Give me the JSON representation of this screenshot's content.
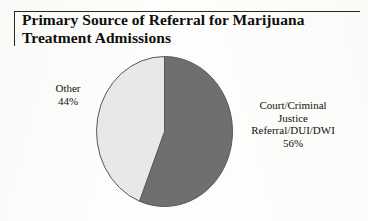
{
  "chart_data": {
    "type": "pie",
    "title": "Primary Source of Referral for Marijuana Treatment Admissions",
    "title_lines": [
      "Primary Source of Referral for Marijuana",
      "Treatment Admissions"
    ],
    "categories": [
      "Court/Criminal Justice Referral/DUI/DWI",
      "Other"
    ],
    "values": [
      56,
      44
    ],
    "value_unit": "%",
    "labels": [
      {
        "name": "court-criminal-justice",
        "lines": [
          "Court/Criminal",
          "Justice",
          "Referral/DUI/DWI",
          "56%"
        ],
        "value": 56,
        "value_text": "56%",
        "color": "#6f6f6f",
        "position": "right"
      },
      {
        "name": "other",
        "lines": [
          "Other",
          "44%"
        ],
        "value": 44,
        "value_text": "44%",
        "color": "#e8e8e8",
        "position": "left"
      }
    ],
    "slice_colors": [
      "#6f6f6f",
      "#e8e8e8"
    ],
    "outline_color": "#5a5750",
    "start_angle_deg": 0,
    "direction": "clockwise",
    "legend": "none",
    "grid": false,
    "xlabel": "",
    "ylabel": ""
  },
  "title": {
    "line1": "Primary Source of Referral for Marijuana",
    "line2": "Treatment Admissions"
  },
  "labels": {
    "other": {
      "name": "Other",
      "percent": "44%"
    },
    "court": {
      "line1": "Court/Criminal",
      "line2": "Justice",
      "line3": "Referral/DUI/DWI",
      "percent": "56%"
    }
  },
  "colors": {
    "dark_slice": "#6f6f6f",
    "light_slice": "#e8e8e8",
    "outline": "#5a5750",
    "rule": "#2b2823",
    "text": "#100e0a",
    "background": "#fdfdfc"
  }
}
